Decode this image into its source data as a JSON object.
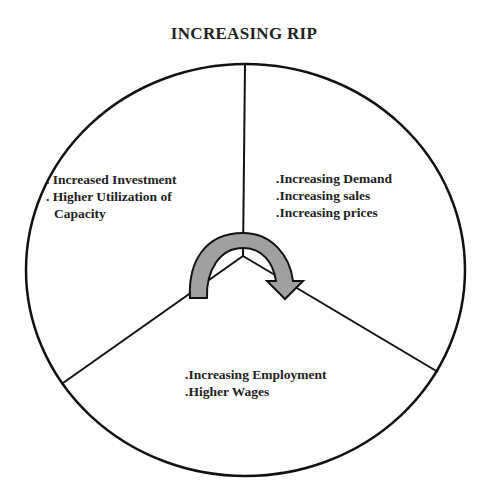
{
  "title": "INCREASING RIP",
  "segments": {
    "left": {
      "lines": [
        ". Increased Investment",
        ". Higher Utilization of",
        "Capacity"
      ]
    },
    "right": {
      "lines": [
        ".Increasing Demand",
        ".Increasing sales",
        ".Increasing prices"
      ]
    },
    "bottom": {
      "lines": [
        ".Increasing Employment",
        ".Higher Wages"
      ]
    }
  },
  "icons": {
    "cycle_arrow": "curved-clockwise-arrow"
  },
  "colors": {
    "outline": "#111111",
    "arrow_fill": "#a0a0a0",
    "text": "#222222",
    "background": "#ffffff"
  }
}
